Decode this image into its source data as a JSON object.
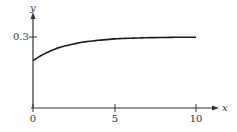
{
  "chart_data": {
    "type": "line",
    "title": "",
    "xlabel": "x",
    "ylabel": "y",
    "xlim": [
      0,
      10
    ],
    "ylim": [
      0,
      0.3
    ],
    "x_ticks": [
      "0",
      "5",
      "10"
    ],
    "y_ticks": [
      "0.3"
    ],
    "grid": false,
    "legend": null,
    "series": [
      {
        "name": "curve",
        "description": "increasing concave curve approaching 0.3 asymptotically",
        "x": [
          0,
          0.5,
          1,
          1.5,
          2,
          3,
          4,
          5,
          6,
          7,
          8,
          9,
          10
        ],
        "values": [
          0.2,
          0.222,
          0.239,
          0.253,
          0.263,
          0.278,
          0.286,
          0.292,
          0.295,
          0.297,
          0.298,
          0.299,
          0.299
        ]
      }
    ]
  },
  "labels": {
    "x_axis": "x",
    "y_axis": "y",
    "x_tick_0": "0",
    "x_tick_5": "5",
    "x_tick_10": "10",
    "y_tick_03": "0.3"
  },
  "colors": {
    "axis": "#333333",
    "curve": "#1a1a1a"
  }
}
